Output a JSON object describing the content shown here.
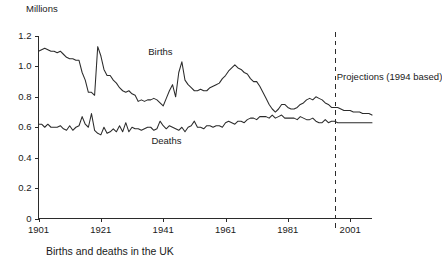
{
  "chart_data": {
    "type": "line",
    "title": "Births and deaths in the UK",
    "xlabel": "",
    "ylabel": "Millions",
    "unit_label": "Millions",
    "xlim": [
      1901,
      2008
    ],
    "ylim": [
      0,
      1.2
    ],
    "grid": false,
    "legend_position": "inline-annotations",
    "ytick_labels": [
      "1.2",
      "1.0",
      "0.8",
      "0.6",
      "0.4",
      "0.2",
      "0"
    ],
    "ytick_values": [
      1.2,
      1.0,
      0.8,
      0.6,
      0.4,
      0.2,
      0
    ],
    "xtick_labels": [
      "1901",
      "1921",
      "1941",
      "1961",
      "1981",
      "2001"
    ],
    "xtick_values": [
      1901,
      1921,
      1941,
      1961,
      1981,
      2001
    ],
    "annotations": [
      {
        "name": "births-label",
        "text": "Births",
        "x": 1942,
        "y": 1.09
      },
      {
        "name": "deaths-label",
        "text": "Deaths",
        "x": 1943,
        "y": 0.5
      },
      {
        "name": "projection-label",
        "text": "Projections (1994 based)",
        "x": 1997,
        "y": 0.93
      }
    ],
    "projection_marker": {
      "label": "Projections (1994 based)",
      "x": 1996,
      "style": "dashed-vertical"
    },
    "series": [
      {
        "name": "Births",
        "x": [
          1901,
          1902,
          1903,
          1904,
          1905,
          1906,
          1907,
          1908,
          1909,
          1910,
          1911,
          1912,
          1913,
          1914,
          1915,
          1916,
          1917,
          1918,
          1919,
          1920,
          1921,
          1922,
          1923,
          1924,
          1925,
          1926,
          1927,
          1928,
          1929,
          1930,
          1931,
          1932,
          1933,
          1934,
          1935,
          1936,
          1937,
          1938,
          1939,
          1940,
          1941,
          1942,
          1943,
          1944,
          1945,
          1946,
          1947,
          1948,
          1949,
          1950,
          1951,
          1952,
          1953,
          1954,
          1955,
          1956,
          1957,
          1958,
          1959,
          1960,
          1961,
          1962,
          1963,
          1964,
          1965,
          1966,
          1967,
          1968,
          1969,
          1970,
          1971,
          1972,
          1973,
          1974,
          1975,
          1976,
          1977,
          1978,
          1979,
          1980,
          1981,
          1982,
          1983,
          1984,
          1985,
          1986,
          1987,
          1988,
          1989,
          1990,
          1991,
          1992,
          1993,
          1994,
          1995,
          1996,
          1997,
          1998,
          1999,
          2000,
          2001,
          2002,
          2003,
          2004,
          2005,
          2006,
          2007,
          2008
        ],
        "values": [
          1.1,
          1.11,
          1.12,
          1.11,
          1.1,
          1.1,
          1.09,
          1.1,
          1.08,
          1.06,
          1.05,
          1.05,
          1.04,
          1.04,
          0.96,
          0.91,
          0.83,
          0.83,
          0.81,
          1.13,
          1.07,
          0.98,
          0.94,
          0.94,
          0.91,
          0.89,
          0.86,
          0.84,
          0.83,
          0.84,
          0.82,
          0.81,
          0.77,
          0.78,
          0.77,
          0.78,
          0.78,
          0.79,
          0.78,
          0.76,
          0.74,
          0.79,
          0.84,
          0.88,
          0.8,
          0.96,
          1.03,
          0.91,
          0.88,
          0.86,
          0.84,
          0.84,
          0.85,
          0.84,
          0.84,
          0.86,
          0.87,
          0.88,
          0.89,
          0.92,
          0.94,
          0.97,
          0.99,
          1.01,
          0.99,
          0.98,
          0.96,
          0.95,
          0.92,
          0.9,
          0.9,
          0.87,
          0.83,
          0.79,
          0.75,
          0.72,
          0.7,
          0.72,
          0.75,
          0.75,
          0.73,
          0.72,
          0.72,
          0.73,
          0.75,
          0.76,
          0.78,
          0.79,
          0.78,
          0.8,
          0.79,
          0.78,
          0.76,
          0.75,
          0.73,
          0.73,
          0.73,
          0.72,
          0.71,
          0.71,
          0.71,
          0.7,
          0.7,
          0.7,
          0.69,
          0.69,
          0.69,
          0.68
        ]
      },
      {
        "name": "Deaths",
        "x": [
          1901,
          1902,
          1903,
          1904,
          1905,
          1906,
          1907,
          1908,
          1909,
          1910,
          1911,
          1912,
          1913,
          1914,
          1915,
          1916,
          1917,
          1918,
          1919,
          1920,
          1921,
          1922,
          1923,
          1924,
          1925,
          1926,
          1927,
          1928,
          1929,
          1930,
          1931,
          1932,
          1933,
          1934,
          1935,
          1936,
          1937,
          1938,
          1939,
          1940,
          1941,
          1942,
          1943,
          1944,
          1945,
          1946,
          1947,
          1948,
          1949,
          1950,
          1951,
          1952,
          1953,
          1954,
          1955,
          1956,
          1957,
          1958,
          1959,
          1960,
          1961,
          1962,
          1963,
          1964,
          1965,
          1966,
          1967,
          1968,
          1969,
          1970,
          1971,
          1972,
          1973,
          1974,
          1975,
          1976,
          1977,
          1978,
          1979,
          1980,
          1981,
          1982,
          1983,
          1984,
          1985,
          1986,
          1987,
          1988,
          1989,
          1990,
          1991,
          1992,
          1993,
          1994,
          1995,
          1996,
          1997,
          1998,
          1999,
          2000,
          2001,
          2002,
          2003,
          2004,
          2005,
          2006,
          2007,
          2008
        ],
        "values": [
          0.62,
          0.62,
          0.6,
          0.62,
          0.6,
          0.6,
          0.6,
          0.61,
          0.59,
          0.58,
          0.61,
          0.58,
          0.6,
          0.61,
          0.67,
          0.62,
          0.6,
          0.69,
          0.58,
          0.56,
          0.55,
          0.6,
          0.56,
          0.57,
          0.59,
          0.57,
          0.61,
          0.57,
          0.63,
          0.57,
          0.6,
          0.59,
          0.59,
          0.58,
          0.59,
          0.6,
          0.6,
          0.58,
          0.59,
          0.64,
          0.61,
          0.59,
          0.61,
          0.6,
          0.59,
          0.58,
          0.6,
          0.57,
          0.6,
          0.61,
          0.64,
          0.6,
          0.6,
          0.59,
          0.61,
          0.61,
          0.6,
          0.61,
          0.61,
          0.6,
          0.63,
          0.64,
          0.63,
          0.62,
          0.64,
          0.64,
          0.63,
          0.65,
          0.66,
          0.66,
          0.65,
          0.67,
          0.67,
          0.67,
          0.66,
          0.68,
          0.66,
          0.67,
          0.68,
          0.66,
          0.66,
          0.66,
          0.66,
          0.65,
          0.67,
          0.66,
          0.65,
          0.65,
          0.66,
          0.64,
          0.63,
          0.63,
          0.65,
          0.63,
          0.64,
          0.64,
          0.63,
          0.63,
          0.63,
          0.63,
          0.63,
          0.63,
          0.63,
          0.63,
          0.63,
          0.63,
          0.63,
          0.63
        ]
      }
    ]
  },
  "caption": {
    "text": "Births and deaths in the UK"
  },
  "colors": {
    "line": "#2b2b2b",
    "axis": "#2b2b2b",
    "background": "#ffffff"
  }
}
